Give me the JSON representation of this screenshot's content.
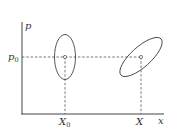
{
  "diagram": {
    "type": "phase-space",
    "axes": {
      "y_label": "p",
      "x_label": "x"
    },
    "ticks": {
      "p0": {
        "base": "p",
        "sub": "0"
      },
      "X0": {
        "base": "X",
        "sub": "0"
      },
      "X": {
        "base": "X",
        "sub": ""
      }
    },
    "ellipses": [
      {
        "name": "upright",
        "cx": 65,
        "cy": 57,
        "rx": 10.5,
        "ry": 22.5,
        "rotation": 0
      },
      {
        "name": "tilted",
        "cx": 141,
        "cy": 57,
        "rx": 27,
        "ry": 10,
        "rotation": -42
      }
    ],
    "colors": {
      "stroke": "#444444",
      "dash": "#555555"
    }
  }
}
